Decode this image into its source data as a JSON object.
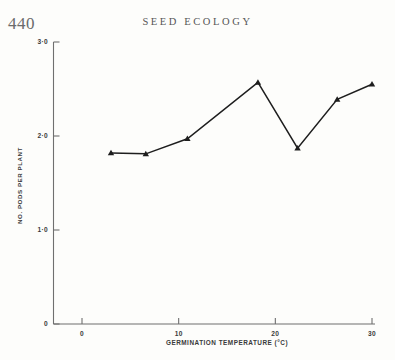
{
  "page": {
    "number": "440",
    "running_head": "SEED ECOLOGY"
  },
  "chart_data": {
    "type": "line",
    "title": "",
    "xlabel": "GERMINATION TEMPERATURE (°C)",
    "ylabel": "NO. PODS PER PLANT",
    "x": [
      3.0,
      6.6,
      10.9,
      18.2,
      22.3,
      26.4,
      30.0
    ],
    "values": [
      1.82,
      1.81,
      1.97,
      2.57,
      1.87,
      2.39,
      2.55
    ],
    "xlim": [
      -1.5,
      30.5
    ],
    "ylim": [
      0,
      3.0
    ],
    "xticks": [
      0,
      10,
      20,
      30
    ],
    "xtick_labels": [
      "0",
      "10",
      "20",
      "30"
    ],
    "yticks": [
      0,
      1.0,
      2.0,
      3.0
    ],
    "ytick_labels": [
      "0",
      "1·0",
      "2·0",
      "3·0"
    ],
    "grid": false,
    "legend": "none",
    "marker": "triangle",
    "marker_color": "#1e1e1e",
    "line_color": "#1e1e1e",
    "axis_color": "#6f6f6f"
  }
}
